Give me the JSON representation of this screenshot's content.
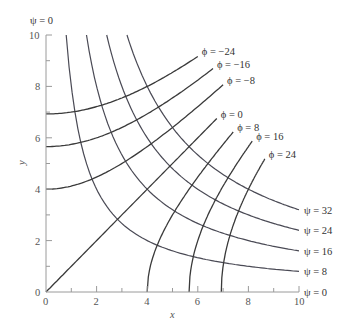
{
  "figure": {
    "type": "flow-net",
    "x_axis": {
      "label": "x",
      "ticks": [
        "0",
        "2",
        "4",
        "6",
        "8",
        "10"
      ],
      "range": [
        0,
        10
      ]
    },
    "y_axis": {
      "label": "y",
      "ticks": [
        "0",
        "2",
        "4",
        "6",
        "8",
        "10"
      ],
      "range": [
        0,
        10
      ]
    },
    "psi_label_top": "ψ = 0",
    "psi_curves": [
      {
        "value": 32,
        "label": "ψ = 32"
      },
      {
        "value": 24,
        "label": "ψ = 24"
      },
      {
        "value": 16,
        "label": "ψ = 16"
      },
      {
        "value": 8,
        "label": "ψ = 8"
      },
      {
        "value": 0,
        "label": "ψ = 0"
      }
    ],
    "phi_curves": [
      {
        "value": -24,
        "label": "ϕ = −24",
        "end_x": 6.0
      },
      {
        "value": -16,
        "label": "ϕ = −16",
        "end_x": 6.6
      },
      {
        "value": -8,
        "label": "ϕ = −8",
        "end_x": 7.0
      },
      {
        "value": 0,
        "label": "ϕ = 0",
        "end_x": 6.75
      },
      {
        "value": 8,
        "label": "ϕ = 8",
        "end_x": 7.4
      },
      {
        "value": 16,
        "label": "ϕ = 16",
        "end_x": 8.15
      },
      {
        "value": 24,
        "label": "ϕ = 24",
        "end_x": 8.65
      }
    ],
    "equations": {
      "psi": "ψ = x·y",
      "phi": "ϕ = (x² − y²)/2"
    }
  }
}
